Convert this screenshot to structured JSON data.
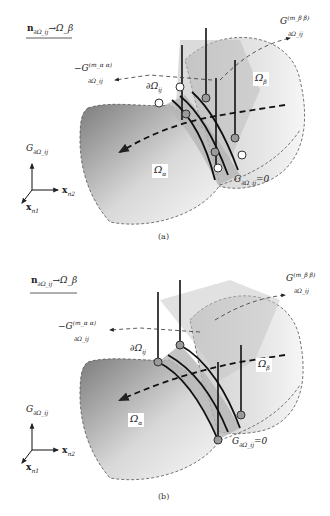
{
  "panels": [
    {
      "id": "a",
      "caption": "(a)",
      "legend": {
        "normal": "n",
        "normal_sub": "∂Ω_ij",
        "arrow": "→",
        "target": "Ω_β"
      },
      "labels": {
        "g_alpha": "−G",
        "g_alpha_sup": "(m_α α)",
        "g_alpha_sub": "∂Ω_ij",
        "g_beta": "G",
        "g_beta_sup": "(m_β β)",
        "g_beta_sub": "∂Ω_ij",
        "interface": "∂Ω",
        "interface_sub": "ij",
        "omega_alpha": "Ω",
        "omega_alpha_sub": "α",
        "omega_beta": "Ω",
        "omega_beta_sub": "β",
        "zero_cond": "G",
        "zero_cond_sub": "∂Ω_ij",
        "zero_cond_val": "=0"
      },
      "axes": {
        "vertical": "G",
        "vertical_sub": "∂Ω_ij",
        "x2": "x",
        "x2_sub": "n2",
        "x1": "x",
        "x1_sub": "n1"
      },
      "node_style": "open-circles-at-boundary"
    },
    {
      "id": "b",
      "caption": "(b)",
      "legend": {
        "normal": "n",
        "normal_sub": "∂Ω_ij",
        "arrow": "→",
        "target": "Ω_β"
      },
      "labels": {
        "g_alpha": "−G",
        "g_alpha_sup": "(m_α α)",
        "g_alpha_sub": "∂Ω_ij",
        "g_beta": "G",
        "g_beta_sup": "(m_β β)",
        "g_beta_sub": "∂Ω_ij",
        "interface": "∂Ω",
        "interface_sub": "ij",
        "omega_alpha": "Ω",
        "omega_alpha_sub": "α",
        "omega_beta": "Ω",
        "omega_beta_sub": "β",
        "zero_cond": "G",
        "zero_cond_sub": "∂Ω_ij",
        "zero_cond_val": "=0"
      },
      "axes": {
        "vertical": "G",
        "vertical_sub": "∂Ω_ij",
        "x2": "x",
        "x2_sub": "n2",
        "x1": "x",
        "x1_sub": "n1"
      },
      "node_style": "filled-grey-circles"
    }
  ],
  "colors": {
    "region_dark": "#8a8a8a",
    "region_light": "#f2f2f2",
    "interface_band": "#c8c8c8",
    "line": "#1a1a1a",
    "dashed": "#444444"
  }
}
